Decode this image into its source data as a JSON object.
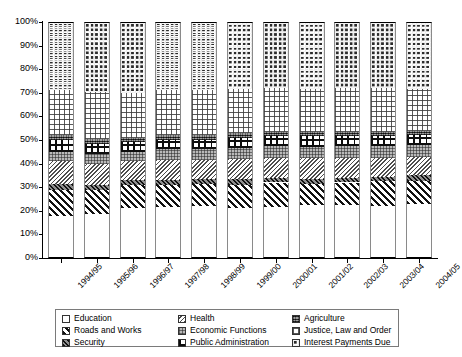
{
  "chart_data": {
    "type": "bar",
    "subtype": "stacked-percentage",
    "title": "",
    "xlabel": "",
    "ylabel": "",
    "ylim": [
      0,
      100
    ],
    "yticks": [
      "0%",
      "10%",
      "20%",
      "30%",
      "40%",
      "50%",
      "60%",
      "70%",
      "80%",
      "90%",
      "100%"
    ],
    "ytick_values": [
      0,
      10,
      20,
      30,
      40,
      50,
      60,
      70,
      80,
      90,
      100
    ],
    "grid": false,
    "legend_position": "bottom",
    "categories": [
      "1994/95",
      "1995/96",
      "1996/97",
      "1997/98",
      "1998/99",
      "1999/00",
      "2000/01",
      "2001/02",
      "2002/03",
      "2003/04",
      "2004/05"
    ],
    "series": [
      {
        "name": "Education",
        "pattern": "blank",
        "values": [
          18.0,
          18.5,
          21.0,
          21.5,
          22.0,
          21.0,
          21.5,
          22.5,
          22.5,
          22.0,
          23.0
        ]
      },
      {
        "name": "Roads and Works",
        "pattern": "diag-wide",
        "values": [
          11.0,
          10.5,
          10.0,
          9.5,
          9.5,
          10.0,
          10.5,
          9.0,
          9.5,
          10.5,
          9.5
        ]
      },
      {
        "name": "Security",
        "pattern": "dark-diag",
        "values": [
          2.5,
          2.0,
          2.0,
          2.0,
          2.0,
          2.5,
          2.0,
          2.0,
          2.0,
          2.0,
          2.5
        ]
      },
      {
        "name": "Health",
        "pattern": "diag-fine",
        "values": [
          9.5,
          9.0,
          8.0,
          8.5,
          8.0,
          8.5,
          8.5,
          9.0,
          8.5,
          8.0,
          8.0
        ]
      },
      {
        "name": "Economic Functions",
        "pattern": "grid-grey",
        "values": [
          4.0,
          4.0,
          4.0,
          4.5,
          4.5,
          4.5,
          5.0,
          4.5,
          5.0,
          5.0,
          5.0
        ]
      },
      {
        "name": "Public Administration",
        "pattern": "cross-bold",
        "values": [
          5.0,
          4.5,
          4.0,
          4.0,
          4.0,
          4.5,
          4.0,
          4.5,
          4.0,
          4.0,
          4.0
        ]
      },
      {
        "name": "Agriculture",
        "pattern": "dark-dense",
        "values": [
          2.0,
          2.0,
          2.0,
          2.0,
          2.0,
          2.0,
          2.0,
          2.0,
          2.0,
          2.0,
          2.0
        ]
      },
      {
        "name": "Justice, Law and Order",
        "pattern": "grid-light",
        "values": [
          19.0,
          20.0,
          19.0,
          19.0,
          19.0,
          18.5,
          18.5,
          18.0,
          18.5,
          18.5,
          17.5
        ]
      },
      {
        "name": "Interest Payments Due",
        "pattern": "dot-dense",
        "values": [
          29.0,
          29.5,
          30.0,
          29.0,
          29.0,
          28.5,
          28.0,
          28.5,
          28.0,
          28.0,
          28.5
        ]
      }
    ]
  },
  "legend": {
    "columns": [
      [
        {
          "label": "Education",
          "key": "education"
        },
        {
          "label": "Roads and Works",
          "key": "roadsandworks"
        },
        {
          "label": "Security",
          "key": "security"
        }
      ],
      [
        {
          "label": "Health",
          "key": "health"
        },
        {
          "label": "Economic Functions",
          "key": "economicfunctions"
        },
        {
          "label": "Public Administration",
          "key": "publicadministration"
        }
      ],
      [
        {
          "label": "Agriculture",
          "key": "agriculture"
        },
        {
          "label": "Justice, Law and Order",
          "key": "justicelawandorder"
        },
        {
          "label": "Interest Payments Due",
          "key": "interestpaymentsdue"
        }
      ]
    ]
  }
}
